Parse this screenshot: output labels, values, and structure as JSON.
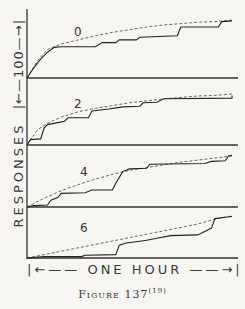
{
  "chart_data": {
    "type": "line",
    "title": "Figure 137",
    "caption": "Figure 137",
    "caption_ref": "(19)",
    "xlabel": "ONE HOUR",
    "ylabel": "RESPONSES",
    "y_scale_label": "100",
    "x_range_minutes": [
      0,
      60
    ],
    "y_range_responses": [
      0,
      100
    ],
    "grid": false,
    "legend": "none",
    "panels": [
      {
        "label": "0",
        "baseline_y": 78,
        "cumulative": [
          [
            0,
            0
          ],
          [
            2,
            15
          ],
          [
            4,
            28
          ],
          [
            6,
            38
          ],
          [
            8,
            45
          ],
          [
            10,
            46
          ],
          [
            20,
            46
          ],
          [
            22,
            52
          ],
          [
            26,
            52
          ],
          [
            27,
            56
          ],
          [
            32,
            56
          ],
          [
            33,
            60
          ],
          [
            44,
            62
          ],
          [
            45,
            75
          ],
          [
            56,
            75
          ],
          [
            57,
            83
          ],
          [
            60,
            84
          ]
        ],
        "smooth": [
          [
            0,
            0
          ],
          [
            3,
            25
          ],
          [
            6,
            42
          ],
          [
            10,
            50
          ],
          [
            15,
            56
          ],
          [
            20,
            62
          ],
          [
            25,
            67
          ],
          [
            30,
            71
          ],
          [
            35,
            75
          ],
          [
            40,
            78
          ],
          [
            45,
            80
          ],
          [
            50,
            82
          ],
          [
            55,
            83
          ],
          [
            60,
            85
          ]
        ]
      },
      {
        "label": "2",
        "baseline_y": 145,
        "cumulative": [
          [
            0,
            0
          ],
          [
            1,
            8
          ],
          [
            4,
            9
          ],
          [
            5,
            25
          ],
          [
            6,
            30
          ],
          [
            9,
            33
          ],
          [
            11,
            35
          ],
          [
            12,
            40
          ],
          [
            18,
            40
          ],
          [
            19,
            50
          ],
          [
            24,
            53
          ],
          [
            28,
            56
          ],
          [
            33,
            57
          ],
          [
            34,
            62
          ],
          [
            38,
            63
          ],
          [
            40,
            68
          ],
          [
            60,
            69
          ],
          [
            60,
            73
          ]
        ],
        "smooth": [
          [
            0,
            0
          ],
          [
            3,
            22
          ],
          [
            6,
            32
          ],
          [
            10,
            41
          ],
          [
            15,
            49
          ],
          [
            20,
            54
          ],
          [
            25,
            58
          ],
          [
            30,
            62
          ],
          [
            35,
            65
          ],
          [
            40,
            68
          ],
          [
            45,
            70
          ],
          [
            50,
            72
          ],
          [
            55,
            73
          ],
          [
            60,
            75
          ]
        ]
      },
      {
        "label": "4",
        "baseline_y": 207,
        "cumulative": [
          [
            0,
            0
          ],
          [
            2,
            2
          ],
          [
            6,
            3
          ],
          [
            7,
            10
          ],
          [
            9,
            14
          ],
          [
            10,
            20
          ],
          [
            17,
            21
          ],
          [
            19,
            25
          ],
          [
            25,
            25
          ],
          [
            26,
            35
          ],
          [
            28,
            52
          ],
          [
            30,
            56
          ],
          [
            35,
            57
          ],
          [
            36,
            63
          ],
          [
            52,
            64
          ],
          [
            54,
            67
          ],
          [
            58,
            68
          ],
          [
            59,
            75
          ],
          [
            60,
            76
          ]
        ],
        "smooth": [
          [
            0,
            0
          ],
          [
            5,
            13
          ],
          [
            10,
            24
          ],
          [
            15,
            33
          ],
          [
            20,
            41
          ],
          [
            25,
            48
          ],
          [
            30,
            54
          ],
          [
            35,
            58
          ],
          [
            40,
            62
          ],
          [
            45,
            66
          ],
          [
            50,
            69
          ],
          [
            55,
            72
          ],
          [
            60,
            75
          ]
        ]
      },
      {
        "label": "6",
        "baseline_y": 258,
        "cumulative": [
          [
            0,
            0
          ],
          [
            5,
            2
          ],
          [
            16,
            2
          ],
          [
            17,
            4
          ],
          [
            26,
            5
          ],
          [
            27,
            19
          ],
          [
            29,
            22
          ],
          [
            32,
            24
          ],
          [
            35,
            26
          ],
          [
            38,
            29
          ],
          [
            42,
            33
          ],
          [
            50,
            34
          ],
          [
            52,
            39
          ],
          [
            54,
            44
          ],
          [
            55,
            58
          ],
          [
            58,
            60
          ],
          [
            60,
            61
          ]
        ],
        "smooth": [
          [
            0,
            0
          ],
          [
            10,
            10
          ],
          [
            20,
            20
          ],
          [
            30,
            30
          ],
          [
            40,
            40
          ],
          [
            50,
            50
          ],
          [
            55,
            57
          ],
          [
            60,
            62
          ]
        ]
      }
    ]
  },
  "figure": {
    "ylabel": "RESPONSES",
    "ylabel_scale": "|←—100—→|",
    "xlabel": "|←—— ONE HOUR ——→|",
    "caption": "Figure 137",
    "caption_ref": "(19)"
  }
}
